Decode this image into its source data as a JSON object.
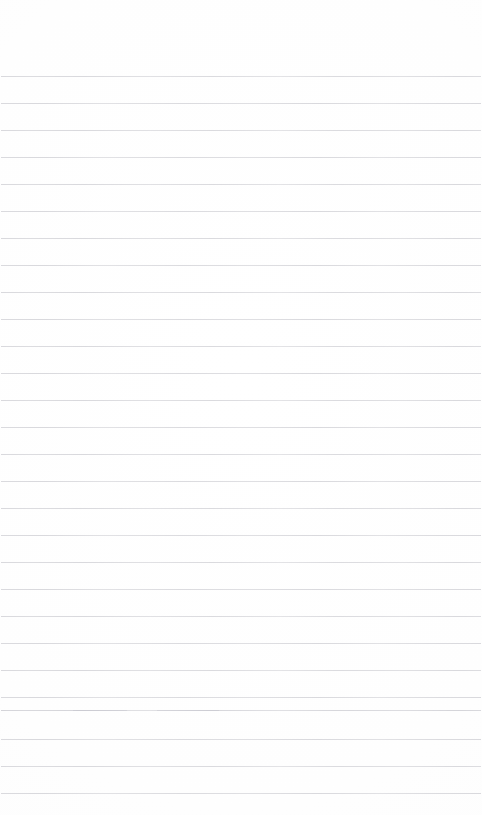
{
  "page": {
    "kind": "scanned-ruled-notebook-page",
    "width_px": 482,
    "height_px": 815,
    "background_color": "#fefefe",
    "text_content": "",
    "has_handwriting": false,
    "has_printed_text": false,
    "has_header": false,
    "has_margin_rule": false
  },
  "ruling": {
    "line_color": "#d9d9dd",
    "line_color_dark": "#d4d4d9",
    "line_thickness_px": 1,
    "line_count": 27,
    "first_line_y": 76,
    "line_spacing_px": 27,
    "line_left_x": 1,
    "line_width_px": 480,
    "lines_y": [
      76,
      103,
      130,
      157,
      184,
      211,
      238,
      265,
      292,
      319,
      346,
      373,
      400,
      427,
      454,
      481,
      508,
      535,
      562,
      589,
      616,
      643,
      670,
      697,
      710,
      739,
      766,
      793
    ]
  },
  "artifacts": {
    "broken_rule": {
      "y": 710,
      "gap_start_x": 127,
      "gap_end_x": 151,
      "note": "scan dropout / erased segment"
    }
  },
  "margins": {
    "top_blank_height_px": 76,
    "bottom_blank_height_px": 21
  }
}
